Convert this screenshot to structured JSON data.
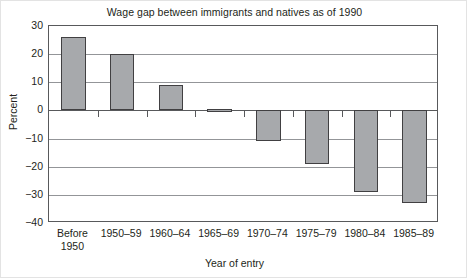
{
  "chart_data": {
    "type": "bar",
    "title": "Wage gap between immigrants and natives as of 1990",
    "xlabel": "Year of entry",
    "ylabel": "Percent",
    "categories": [
      "Before 1950",
      "1950–59",
      "1960–64",
      "1965–69",
      "1970–74",
      "1975–79",
      "1980–84",
      "1985–89"
    ],
    "category_lines": [
      [
        "Before",
        "1950"
      ],
      [
        "1950–59"
      ],
      [
        "1960–64"
      ],
      [
        "1965–69"
      ],
      [
        "1970–74"
      ],
      [
        "1975–79"
      ],
      [
        "1980–84"
      ],
      [
        "1985–89"
      ]
    ],
    "values": [
      26,
      20,
      9,
      0.5,
      -11,
      -19,
      -29,
      -33
    ],
    "ylim": [
      -40,
      30
    ],
    "yticks": [
      30,
      20,
      10,
      0,
      -10,
      -20,
      -30,
      -40
    ],
    "ytick_labels": [
      "30",
      "20",
      "10",
      "0",
      "−10",
      "−20",
      "−30",
      "−40"
    ],
    "grid": true,
    "legend": "none",
    "bar_color": "#a7a9ac",
    "bar_border_color": "#414042",
    "grid_color": "#939598",
    "axis_color": "#58595b",
    "text_color": "#231f20"
  }
}
